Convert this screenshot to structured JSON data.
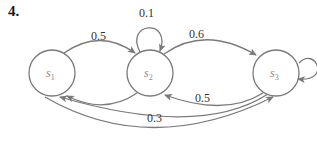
{
  "problem_number": "4.",
  "nodes": [
    {
      "id": "s1",
      "label": "s",
      "sub": "1"
    },
    {
      "id": "s2",
      "label": "s",
      "sub": "2"
    },
    {
      "id": "s3",
      "label": "s",
      "sub": "3"
    }
  ],
  "edges": [
    {
      "from": "s1",
      "to": "s2",
      "label": "0.5"
    },
    {
      "from": "s2",
      "to": "s2",
      "label": "0.1"
    },
    {
      "from": "s2",
      "to": "s3",
      "label": "0.6"
    },
    {
      "from": "s2",
      "to": "s1",
      "label": ""
    },
    {
      "from": "s3",
      "to": "s2",
      "label": "0.5"
    },
    {
      "from": "s3",
      "to": "s3",
      "label": ""
    },
    {
      "from": "s3",
      "to": "s1",
      "label": ""
    },
    {
      "from": "s1",
      "to": "s3",
      "label": "0.3"
    }
  ],
  "colors": {
    "stroke": "#7a7a7a",
    "text": "#333333"
  }
}
